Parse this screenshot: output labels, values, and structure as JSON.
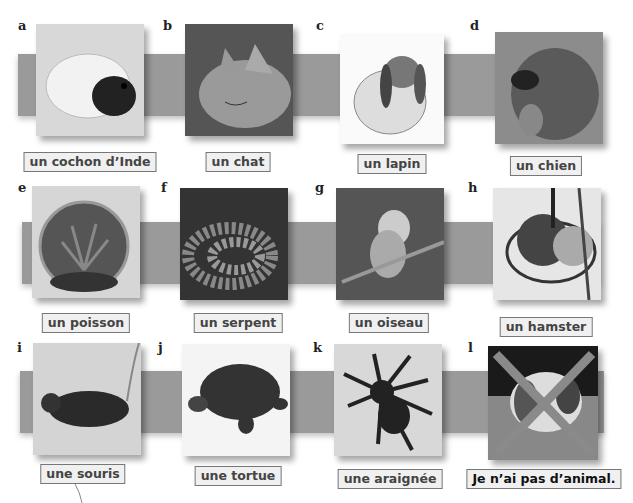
{
  "items": [
    {
      "letter": "a",
      "label": "un cochon d’Inde",
      "icon": "guinea-pig-photo"
    },
    {
      "letter": "b",
      "label": "un chat",
      "icon": "cat-photo"
    },
    {
      "letter": "c",
      "label": "un lapin",
      "icon": "rabbit-photo"
    },
    {
      "letter": "d",
      "label": "un chien",
      "icon": "dog-photo"
    },
    {
      "letter": "e",
      "label": "un poisson",
      "icon": "fishbowl-photo"
    },
    {
      "letter": "f",
      "label": "un serpent",
      "icon": "snake-photo"
    },
    {
      "letter": "g",
      "label": "un oiseau",
      "icon": "budgie-photo"
    },
    {
      "letter": "h",
      "label": "un hamster",
      "icon": "hamster-photo"
    },
    {
      "letter": "i",
      "label": "une souris",
      "icon": "mouse-photo"
    },
    {
      "letter": "j",
      "label": "une tortue",
      "icon": "tortoise-photo"
    },
    {
      "letter": "k",
      "label": "une araignée",
      "icon": "spider-photo"
    },
    {
      "letter": "l",
      "label": "Je n’ai pas d’animal.",
      "icon": "crossed-out-dog-photo"
    }
  ],
  "colors": {
    "band": "#9a9a9a",
    "label_border": "#777777",
    "label_bg": "#f0f0f0",
    "cross": "#8a8a8a"
  }
}
